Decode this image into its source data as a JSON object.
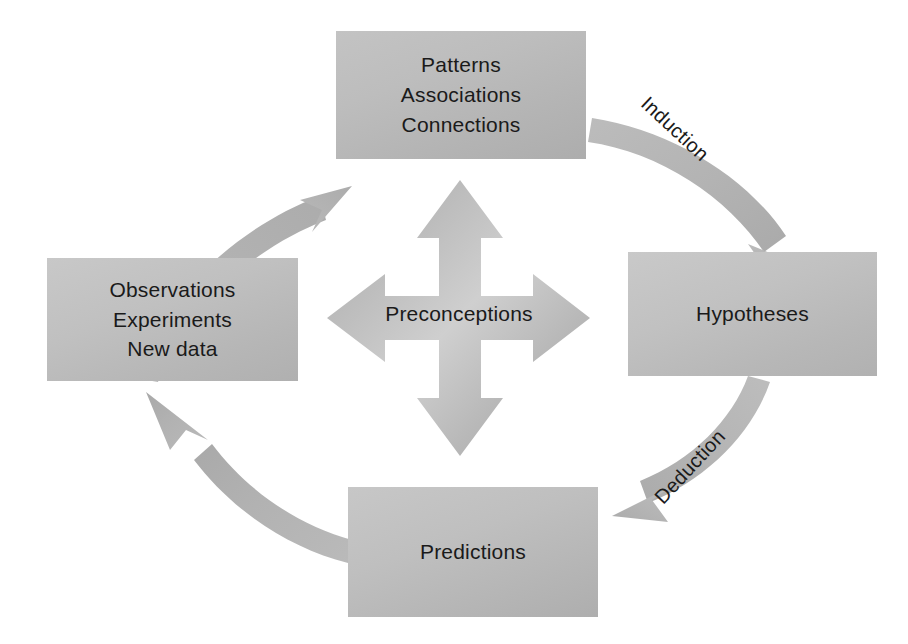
{
  "diagram": {
    "background_color": "#ffffff",
    "box_fill_color": "#bfbfbf",
    "arrow_color": "#b2b2b2",
    "text_color": "#1a1a1a",
    "nodes": [
      {
        "id": "patterns",
        "position": "top",
        "lines": [
          "Patterns",
          "Associations",
          "Connections"
        ]
      },
      {
        "id": "observations",
        "position": "left",
        "lines": [
          "Observations",
          "Experiments",
          "New data"
        ]
      },
      {
        "id": "hypotheses",
        "position": "right",
        "lines": [
          "Hypotheses"
        ]
      },
      {
        "id": "predictions",
        "position": "bottom",
        "lines": [
          "Predictions"
        ]
      }
    ],
    "center": {
      "id": "preconceptions",
      "label": "Preconceptions",
      "icon": "four-way-arrow-icon"
    },
    "edges": [
      {
        "id": "observations-to-patterns",
        "from": "observations",
        "to": "patterns",
        "label": "",
        "icon": "curved-arrow-icon"
      },
      {
        "id": "patterns-to-hypotheses",
        "from": "patterns",
        "to": "hypotheses",
        "label": "Induction",
        "icon": "curved-arrow-icon"
      },
      {
        "id": "hypotheses-to-predictions",
        "from": "hypotheses",
        "to": "predictions",
        "label": "Deduction",
        "icon": "curved-arrow-icon"
      },
      {
        "id": "predictions-to-observations",
        "from": "predictions",
        "to": "observations",
        "label": "",
        "icon": "curved-arrow-icon"
      }
    ]
  }
}
